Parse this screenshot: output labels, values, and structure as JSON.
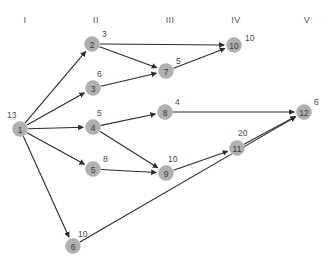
{
  "diagram": {
    "title": "",
    "type": "directed-network-graph",
    "colors": {
      "node_fill": "#b0b0b0",
      "node_text": "#3a3a3a",
      "edge": "#2b2b2b",
      "label": "#4a4a4a",
      "header": "#555555",
      "background": "#ffffff"
    },
    "columns": [
      {
        "label": "I",
        "x": 25
      },
      {
        "label": "II",
        "x": 96
      },
      {
        "label": "III",
        "x": 170
      },
      {
        "label": "IV",
        "x": 236
      },
      {
        "label": "V",
        "x": 307
      }
    ],
    "header_y": 23,
    "node_radius": 7.5,
    "nodes": [
      {
        "id": "1",
        "label": "13",
        "x": 20,
        "y": 129,
        "label_dx": -13,
        "label_dy": -11
      },
      {
        "id": "2",
        "label": "3",
        "x": 92,
        "y": 44,
        "label_dx": 10,
        "label_dy": -7
      },
      {
        "id": "3",
        "label": "6",
        "x": 93,
        "y": 88,
        "label_dx": 4,
        "label_dy": -11
      },
      {
        "id": "4",
        "label": "5",
        "x": 93,
        "y": 127,
        "label_dx": 4,
        "label_dy": -11
      },
      {
        "id": "5",
        "label": "8",
        "x": 93,
        "y": 169,
        "label_dx": 10,
        "label_dy": -7
      },
      {
        "id": "6",
        "label": "10",
        "x": 73,
        "y": 246,
        "label_dx": 5,
        "label_dy": -9
      },
      {
        "id": "7",
        "label": "5",
        "x": 166,
        "y": 71,
        "label_dx": 10,
        "label_dy": -7
      },
      {
        "id": "8",
        "label": "4",
        "x": 165,
        "y": 112,
        "label_dx": 10,
        "label_dy": -7
      },
      {
        "id": "9",
        "label": "10",
        "x": 166,
        "y": 173,
        "label_dx": 2,
        "label_dy": -11
      },
      {
        "id": "10",
        "label": "10",
        "x": 234,
        "y": 45,
        "label_dx": 11,
        "label_dy": -4
      },
      {
        "id": "11",
        "label": "20",
        "x": 237,
        "y": 148,
        "label_dx": 1,
        "label_dy": -12
      },
      {
        "id": "12",
        "label": "6",
        "x": 304,
        "y": 112,
        "label_dx": 10,
        "label_dy": -7
      }
    ],
    "edges": [
      {
        "from": "1",
        "to": "2"
      },
      {
        "from": "1",
        "to": "3"
      },
      {
        "from": "1",
        "to": "4"
      },
      {
        "from": "1",
        "to": "5"
      },
      {
        "from": "1",
        "to": "6"
      },
      {
        "from": "2",
        "to": "10"
      },
      {
        "from": "2",
        "to": "7"
      },
      {
        "from": "3",
        "to": "7"
      },
      {
        "from": "4",
        "to": "8"
      },
      {
        "from": "4",
        "to": "9"
      },
      {
        "from": "5",
        "to": "9"
      },
      {
        "from": "7",
        "to": "10"
      },
      {
        "from": "8",
        "to": "12"
      },
      {
        "from": "9",
        "to": "11"
      },
      {
        "from": "11",
        "to": "12"
      },
      {
        "from": "6",
        "to": "12"
      }
    ]
  },
  "chart_data": {
    "type": "diagram",
    "title": "",
    "nodes": [
      {
        "id": 1,
        "value": 13,
        "stage": "I"
      },
      {
        "id": 2,
        "value": 3,
        "stage": "II"
      },
      {
        "id": 3,
        "value": 6,
        "stage": "II"
      },
      {
        "id": 4,
        "value": 5,
        "stage": "II"
      },
      {
        "id": 5,
        "value": 8,
        "stage": "II"
      },
      {
        "id": 6,
        "value": 10,
        "stage": "II"
      },
      {
        "id": 7,
        "value": 5,
        "stage": "III"
      },
      {
        "id": 8,
        "value": 4,
        "stage": "III"
      },
      {
        "id": 9,
        "value": 10,
        "stage": "III"
      },
      {
        "id": 10,
        "value": 10,
        "stage": "IV"
      },
      {
        "id": 11,
        "value": 20,
        "stage": "IV"
      },
      {
        "id": 12,
        "value": 6,
        "stage": "V"
      }
    ],
    "edges": [
      [
        1,
        2
      ],
      [
        1,
        3
      ],
      [
        1,
        4
      ],
      [
        1,
        5
      ],
      [
        1,
        6
      ],
      [
        2,
        10
      ],
      [
        2,
        7
      ],
      [
        3,
        7
      ],
      [
        4,
        8
      ],
      [
        4,
        9
      ],
      [
        5,
        9
      ],
      [
        7,
        10
      ],
      [
        8,
        12
      ],
      [
        9,
        11
      ],
      [
        11,
        12
      ],
      [
        6,
        12
      ]
    ],
    "stages": [
      "I",
      "II",
      "III",
      "IV",
      "V"
    ]
  }
}
